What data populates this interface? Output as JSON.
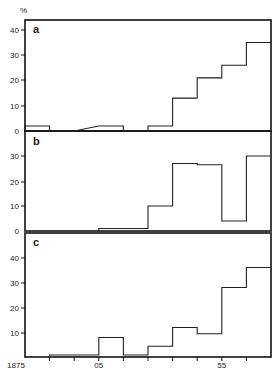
{
  "chart_data": [
    {
      "type": "bar",
      "panel": "a",
      "style": "step-histogram",
      "categories": [
        "1875-1885",
        "1885-1895",
        "1895-1905",
        "1905-1915",
        "1915-1925",
        "1925-1935",
        "1935-1945",
        "1945-1955",
        "1955-1965",
        "1965-1975"
      ],
      "values": [
        2,
        0,
        0,
        2,
        0,
        2,
        13,
        21,
        26,
        35
      ],
      "ylabel": "%",
      "yticks": [
        0,
        10,
        20,
        30,
        40
      ],
      "ylim": [
        0,
        44
      ]
    },
    {
      "type": "bar",
      "panel": "b",
      "style": "step-histogram",
      "categories": [
        "1875-1885",
        "1885-1895",
        "1895-1905",
        "1905-1915",
        "1915-1925",
        "1925-1935",
        "1935-1945",
        "1945-1955",
        "1955-1965",
        "1965-1975"
      ],
      "values": [
        0,
        0,
        0,
        1,
        1,
        10,
        27,
        26.5,
        4,
        30
      ],
      "ylabel": "%",
      "yticks": [
        0,
        10,
        20,
        30
      ],
      "ylim": [
        0,
        40
      ]
    },
    {
      "type": "bar",
      "panel": "c",
      "style": "step-histogram",
      "categories": [
        "1875-1885",
        "1885-1895",
        "1895-1905",
        "1905-1915",
        "1915-1925",
        "1925-1935",
        "1935-1945",
        "1945-1955",
        "1955-1965",
        "1965-1975"
      ],
      "values": [
        0,
        1,
        1,
        8,
        1,
        4.5,
        12,
        9.5,
        28,
        36
      ],
      "ylabel": "%",
      "yticks": [
        10,
        20,
        30,
        40
      ],
      "ylim": [
        0,
        50
      ],
      "xlabel": "",
      "xticks": [
        "1875",
        "05",
        "55"
      ],
      "xrange": [
        1875,
        1975
      ],
      "xtick_step_years": 10
    }
  ],
  "labels": {
    "y_unit": "%",
    "panel_a": "a",
    "panel_b": "b",
    "panel_c": "c",
    "x_start": "1875",
    "x_mid1": "05",
    "x_mid2": "55",
    "a_ticks": [
      "40",
      "30",
      "20",
      "10",
      "0"
    ],
    "b_ticks": [
      "30",
      "20",
      "10",
      "0"
    ],
    "c_ticks": [
      "40",
      "30",
      "20",
      "10"
    ]
  }
}
